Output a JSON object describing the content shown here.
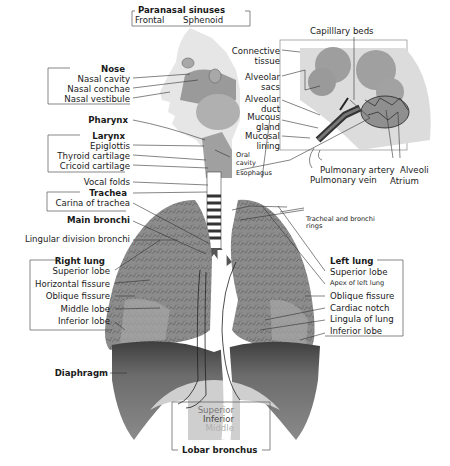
{
  "diagram": {
    "colors": {
      "background": "#ffffff",
      "lung_fill": "#8a8a8a",
      "lung_dark": "#4a4a4a",
      "diaphragm": "#6e6e6e",
      "head_tissue": "#b8b8b8",
      "inset_background": "#d9d9d9",
      "alveoli": "#9c9c9c",
      "leader_line": "#333333",
      "bracket": "#555555"
    },
    "groups": {
      "paranasal_sinuses": {
        "title": "Paranasal sinuses",
        "items": [
          "Frontal",
          "Sphenoid"
        ]
      },
      "nose": {
        "title": "Nose",
        "items": [
          "Nasal cavity",
          "Nasal conchae",
          "Nasal vestibule"
        ]
      },
      "pharynx": {
        "title": "Pharynx"
      },
      "larynx": {
        "title": "Larynx",
        "items": [
          "Epiglottis",
          "Thyroid cartilage",
          "Cricoid cartilage"
        ]
      },
      "vocal_folds": {
        "label": "Vocal folds"
      },
      "trachea": {
        "title": "Trachea",
        "items": [
          "Carina of trachea"
        ]
      },
      "main_bronchi": {
        "title": "Main bronchi"
      },
      "lingular_division": {
        "label": "Lingular division bronchi"
      },
      "right_lung": {
        "title": "Right lung",
        "items": [
          "Superior lobe",
          "Horizontal fissure",
          "Oblique fissure",
          "Middle lobe",
          "Inferior lobe"
        ]
      },
      "diaphragm": {
        "title": "Diaphragm"
      },
      "lobar_bronchus": {
        "title": "Lobar bronchus",
        "items": [
          "Superior",
          "Inferior",
          "Middle"
        ]
      },
      "left_lung": {
        "title": "Left lung",
        "items": [
          "Superior lobe",
          "Apex of left lung",
          "Oblique fissure",
          "Cardiac notch",
          "Lingula of lung",
          "Inferior lobe"
        ]
      },
      "oral": {
        "items": [
          "Oral cavity",
          "Esophagus"
        ]
      },
      "tracheal_rings": {
        "label_line1": "Tracheal and bronchi",
        "label_line2": "rings"
      },
      "alveoli_inset": {
        "top": "Capilllary beds",
        "left": [
          "Connective tissue",
          "Alveolar sacs",
          "Alveolar duct",
          "Mucous gland",
          "Mucosal lining"
        ],
        "bottom": [
          "Pulmonary artery",
          "Pulmonary vein",
          "Alveoli",
          "Atrium"
        ]
      }
    }
  }
}
